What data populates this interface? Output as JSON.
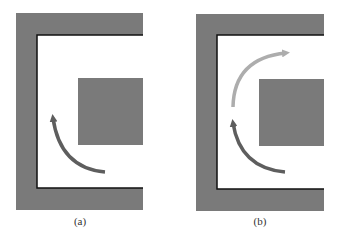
{
  "panels": [
    {
      "label": "(a)",
      "wall_color": "#7a7a7a",
      "obstacle_color": "#7a7a7a",
      "arrow_dark": "#5e5e5e"
    },
    {
      "label": "(b)",
      "wall_color": "#7a7a7a",
      "obstacle_color": "#7a7a7a",
      "arrow_dark": "#5e5e5e",
      "arrow_light": "#adadad"
    }
  ]
}
